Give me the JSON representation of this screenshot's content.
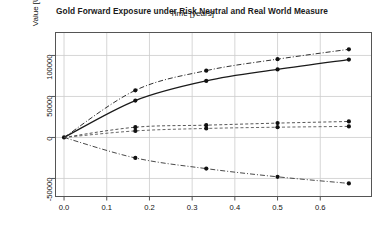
{
  "chart_data": {
    "type": "line",
    "title": "Gold Forward Exposure under Risk Neutral and Real World Measure",
    "xlabel": "Time [years]",
    "ylabel": "Value [USD]",
    "xlim": [
      -0.02,
      0.72
    ],
    "ylim": [
      -72000,
      128000
    ],
    "grid": true,
    "legend": "none",
    "xticks": [
      "0.0",
      "0.1",
      "0.2",
      "0.3",
      "0.4",
      "0.5",
      "0.6"
    ],
    "xtick_values": [
      0.0,
      0.1,
      0.2,
      0.3,
      0.4,
      0.5,
      0.6
    ],
    "yticks": [
      "-50000",
      "0",
      "50000",
      "100000"
    ],
    "ytick_values": [
      -50000,
      0,
      50000,
      100000
    ],
    "x": [
      0.0,
      0.167,
      0.333,
      0.5,
      0.667
    ],
    "series": [
      {
        "name": "PFE Risk Neutral",
        "style": "dashdot",
        "color": "#1a1a1a",
        "marker": "filled-circle",
        "values": [
          0,
          57500,
          81500,
          95500,
          107500
        ]
      },
      {
        "name": "EE Risk Neutral",
        "style": "solid",
        "color": "#1a1a1a",
        "marker": "filled-circle",
        "values": [
          0,
          45000,
          69000,
          83000,
          95000
        ]
      },
      {
        "name": "EE Real World",
        "style": "dashed",
        "color": "#444444",
        "marker": "filled-circle",
        "values": [
          0,
          12500,
          15000,
          17500,
          19500
        ]
      },
      {
        "name": "Expected Value Real World",
        "style": "dashed",
        "color": "#555555",
        "marker": "filled-circle",
        "values": [
          0,
          8000,
          11000,
          12500,
          13500
        ]
      },
      {
        "name": "Negative Exposure Real World",
        "style": "dashdot",
        "color": "#333333",
        "marker": "filled-circle",
        "values": [
          0,
          -25000,
          -38000,
          -48000,
          -56000
        ]
      }
    ]
  },
  "axes": {
    "title": "Gold Forward Exposure under Risk Neutral and Real World Measure",
    "x_axis_title": "Time [years]",
    "y_axis_title": "Value [USD]"
  }
}
